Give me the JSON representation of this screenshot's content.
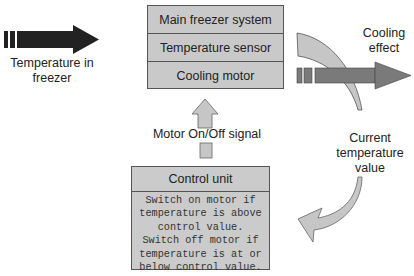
{
  "system": {
    "rows": [
      "Main freezer system",
      "Temperature sensor",
      "Cooling motor"
    ]
  },
  "control_unit": {
    "title": "Control unit",
    "body": "Switch on motor if\ntemperature is above\ncontrol value.\nSwitch off motor if\ntemperature is at or\nbelow control value."
  },
  "labels": {
    "input": "Temperature in\nfreezer",
    "output": "Cooling\neffect",
    "signal": "Motor On/Off signal",
    "feedback": "Current\ntemperature\nvalue"
  },
  "colors": {
    "input_arrow": "#222222",
    "output_arrow": "#7a7a7a",
    "feedback_arrow": "#c4c4c4",
    "box_fill": "#c9c9c9"
  }
}
